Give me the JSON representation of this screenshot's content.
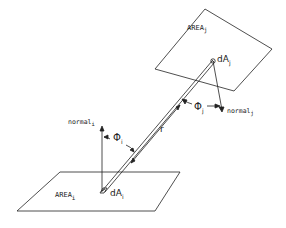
{
  "diagram": {
    "type": "radiative-view-factor-geometry",
    "surfaces": [
      {
        "id": "area_i",
        "label": "AREA",
        "subscript": "i"
      },
      {
        "id": "area_j",
        "label": "AREA",
        "subscript": "j"
      }
    ],
    "elements": [
      {
        "id": "dA_i",
        "label": "dA",
        "subscript": "i"
      },
      {
        "id": "dA_j",
        "label": "dA",
        "subscript": "j"
      }
    ],
    "normals": [
      {
        "id": "normal_i",
        "label": "normal",
        "subscript": "i"
      },
      {
        "id": "normal_j",
        "label": "normal",
        "subscript": "j"
      }
    ],
    "angles": [
      {
        "id": "phi_i",
        "symbol": "Φ",
        "subscript": "i"
      },
      {
        "id": "phi_j",
        "symbol": "Φ",
        "subscript": "j"
      }
    ],
    "distance": {
      "id": "r",
      "symbol": "r"
    },
    "colors": {
      "stroke": "#222222",
      "background": "#ffffff"
    }
  }
}
